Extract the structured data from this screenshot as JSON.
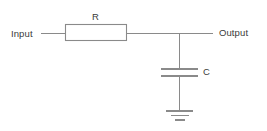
{
  "diagram": {
    "type": "schematic",
    "background_color": "#ffffff",
    "line_color": "#8a8a8a",
    "text_color": "#3a3a3a",
    "labels": {
      "input": "Input",
      "output": "Output",
      "resistor": "R",
      "capacitor": "C"
    },
    "components": [
      {
        "name": "resistor",
        "symbol": "rectangle-box",
        "label": "R"
      },
      {
        "name": "capacitor",
        "symbol": "parallel-plates",
        "label": "C"
      },
      {
        "name": "ground",
        "symbol": "three-bar-ground",
        "label": ""
      }
    ],
    "terminals": [
      {
        "name": "input-terminal",
        "label": "Input"
      },
      {
        "name": "output-terminal",
        "label": "Output"
      }
    ]
  }
}
